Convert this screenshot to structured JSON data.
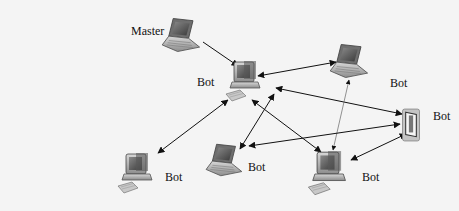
{
  "diagram": {
    "type": "botnet-network",
    "nodes": [
      {
        "id": "master",
        "device": "laptop",
        "label": "Master"
      },
      {
        "id": "bot-center",
        "device": "desktop",
        "label": "Bot"
      },
      {
        "id": "bot-top-right",
        "device": "laptop",
        "label": "Bot"
      },
      {
        "id": "bot-right",
        "device": "pda",
        "label": "Bot"
      },
      {
        "id": "bot-bottom-left",
        "device": "desktop",
        "label": "Bot"
      },
      {
        "id": "bot-bottom-center",
        "device": "laptop",
        "label": "Bot"
      },
      {
        "id": "bot-bottom-right",
        "device": "desktop",
        "label": "Bot"
      }
    ],
    "edges": [
      {
        "from": "master",
        "to": "bot-center",
        "arrow": "to"
      },
      {
        "from": "bot-center",
        "to": "bot-top-right",
        "arrow": "both"
      },
      {
        "from": "bot-center",
        "to": "bot-right",
        "arrow": "both"
      },
      {
        "from": "bot-center",
        "to": "bot-bottom-left",
        "arrow": "both"
      },
      {
        "from": "bot-center",
        "to": "bot-bottom-center",
        "arrow": "both"
      },
      {
        "from": "bot-center",
        "to": "bot-bottom-right",
        "arrow": "both"
      },
      {
        "from": "bot-top-right",
        "to": "bot-bottom-right",
        "arrow": "both"
      },
      {
        "from": "bot-bottom-center",
        "to": "bot-right",
        "arrow": "both"
      },
      {
        "from": "bot-bottom-right",
        "to": "bot-right",
        "arrow": "both"
      }
    ]
  },
  "labels": {
    "master": "Master",
    "bot_center": "Bot",
    "bot_top_right": "Bot",
    "bot_right": "Bot",
    "bot_bottom_left": "Bot",
    "bot_bottom_center": "Bot",
    "bot_bottom_right": "Bot"
  }
}
